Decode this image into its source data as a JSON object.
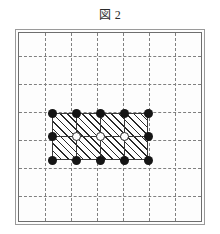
{
  "figure": {
    "caption": "図 2",
    "caption_label": "Figure 2",
    "language": "ja"
  },
  "colors": {
    "background": "#ffffff",
    "frame_outer": "#9a9a9a",
    "frame_inner": "#6e6e6e",
    "grid_dashed": "#808080",
    "mesh_line": "#3a3a3a",
    "node_filled": "#151515",
    "node_open_fill": "#ffffff",
    "node_open_stroke": "#2a2a2a",
    "hatch": "#2a2a2a",
    "caption_text": "#2b2b2b"
  },
  "chart_data": {
    "type": "scatter",
    "title": "図 2",
    "xlabel": "",
    "ylabel": "",
    "grid": true,
    "legend": null,
    "xlim": [
      0,
      7
    ],
    "ylim": [
      0,
      7
    ],
    "background_grid": {
      "vertical_lines": [
        1,
        2,
        3,
        4,
        5,
        6
      ],
      "horizontal_lines": [
        1,
        2,
        3,
        4,
        5,
        6
      ],
      "style": "dashed",
      "spacing_units": 1
    },
    "region": {
      "name": "hatched-mesh-region",
      "fill": "diagonal-hatch",
      "hatch_angle_deg": 45,
      "x_range": [
        1.25,
        5.0
      ],
      "y_range": [
        2.75,
        4.75
      ],
      "columns": 4,
      "rows": 2,
      "internal_vertical_lines": [
        2.1875,
        3.125,
        4.0625
      ],
      "internal_horizontal_lines": [
        3.75
      ]
    },
    "series": [
      {
        "name": "boundary-nodes",
        "marker": "filled-circle",
        "count": 12,
        "points": [
          {
            "x": 1.25,
            "y": 4.75
          },
          {
            "x": 2.1875,
            "y": 4.75
          },
          {
            "x": 3.125,
            "y": 4.75
          },
          {
            "x": 4.0625,
            "y": 4.75
          },
          {
            "x": 5.0,
            "y": 4.75
          },
          {
            "x": 1.25,
            "y": 3.75
          },
          {
            "x": 5.0,
            "y": 3.75
          },
          {
            "x": 1.25,
            "y": 2.75
          },
          {
            "x": 2.1875,
            "y": 2.75
          },
          {
            "x": 3.125,
            "y": 2.75
          },
          {
            "x": 4.0625,
            "y": 2.75
          },
          {
            "x": 5.0,
            "y": 2.75
          }
        ]
      },
      {
        "name": "interior-nodes",
        "marker": "open-circle",
        "count": 3,
        "points": [
          {
            "x": 2.1875,
            "y": 3.75
          },
          {
            "x": 3.125,
            "y": 3.75
          },
          {
            "x": 4.0625,
            "y": 3.75
          }
        ]
      }
    ]
  },
  "geometry": {
    "frame": {
      "left": 15,
      "top": 29,
      "width": 190,
      "height": 196
    },
    "frame_inner": {
      "left": 18,
      "top": 32,
      "width": 184,
      "height": 190
    },
    "grid": {
      "left": 19,
      "top": 33,
      "width": 182,
      "height": 188,
      "v_positions": [
        26,
        52,
        78,
        104,
        130,
        156
      ],
      "h_positions": [
        23,
        51,
        79,
        107,
        135,
        163
      ]
    },
    "mesh": {
      "left": 52,
      "top": 113,
      "width": 96,
      "height": 47,
      "v_positions": [
        24,
        48,
        72
      ],
      "h_positions": [
        23
      ]
    },
    "nodes_filled": [
      {
        "x": 52,
        "y": 113
      },
      {
        "x": 76,
        "y": 113
      },
      {
        "x": 100,
        "y": 113
      },
      {
        "x": 124,
        "y": 113
      },
      {
        "x": 148,
        "y": 113
      },
      {
        "x": 52,
        "y": 136
      },
      {
        "x": 148,
        "y": 136
      },
      {
        "x": 52,
        "y": 160
      },
      {
        "x": 76,
        "y": 160
      },
      {
        "x": 100,
        "y": 160
      },
      {
        "x": 124,
        "y": 160
      },
      {
        "x": 148,
        "y": 160
      }
    ],
    "nodes_open": [
      {
        "x": 76,
        "y": 136
      },
      {
        "x": 100,
        "y": 136
      },
      {
        "x": 124,
        "y": 136
      }
    ]
  }
}
